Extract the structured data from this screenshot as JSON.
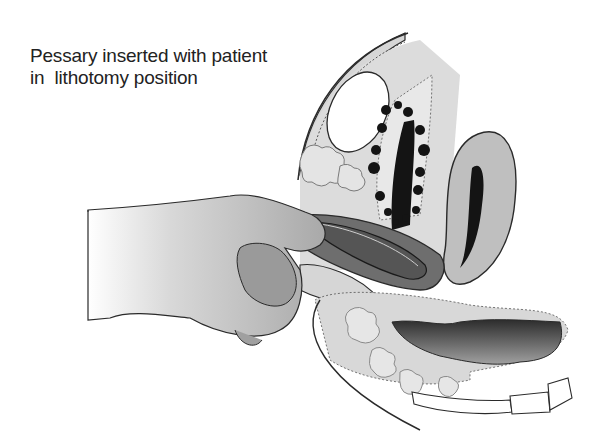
{
  "caption": {
    "line1": "Pessary inserted with patient",
    "line2": "in  lithotomy position"
  },
  "illustration": {
    "subject": "Pessary insertion, sagittal pelvic view",
    "colors": {
      "outline": "#2a2a2a",
      "tissue_light": "#d6d6d6",
      "tissue_mid": "#a8a8a8",
      "hand": "#bdbdbd",
      "hand_shadow": "#8f8f8f",
      "vaginal_canal": "#6e6e6e",
      "pessary": "#555555",
      "dark_lumen": "#141414",
      "bone": "#ffffff"
    }
  }
}
